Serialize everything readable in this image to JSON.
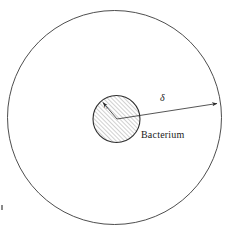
{
  "figure": {
    "background_color": "#ffffff",
    "stroke_color": "#3a3a3a",
    "hatch_color": "#555555",
    "labels": {
      "bacterium": "Bacterium",
      "delta": "δ",
      "inner_radius": "r₀"
    },
    "outer_circle": {
      "name": "diffusion-layer-boundary",
      "cx": 114.5,
      "cy": 117.5,
      "r": 107,
      "fill": "none",
      "stroke_width": 0.9
    },
    "inner_circle": {
      "name": "bacterium-body",
      "cx": 116.5,
      "cy": 119,
      "r": 23.5,
      "fill": "hatched",
      "hatch_angle_deg": 45,
      "hatch_spacing_px": 3,
      "stroke_width": 1.1
    },
    "delta_arrow": {
      "name": "delta-dimension-arrow",
      "from_x": 117,
      "from_y": 119,
      "to_x": 219,
      "to_y": 103,
      "arrowheads": "end",
      "label": "δ",
      "label_x": 160,
      "label_y": 93
    },
    "radius_arrow": {
      "name": "inner-radius-arrow",
      "from_x": 117,
      "from_y": 119,
      "to_x": 102,
      "to_y": 101,
      "arrowheads": "end",
      "label": "r₀",
      "label_x": 105,
      "label_y": 105
    },
    "bacterium_label_pos": {
      "x": 141,
      "y": 136
    },
    "stray_mark": {
      "x": 1,
      "y": 205,
      "w": 2,
      "h": 5
    }
  }
}
